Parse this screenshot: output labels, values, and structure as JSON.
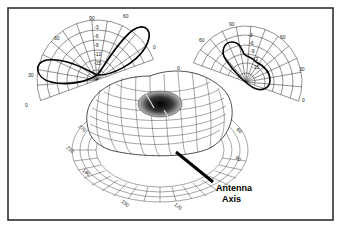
{
  "figure": {
    "frame_color": "#222222",
    "background": "#ffffff"
  },
  "left_polar": {
    "name": "elevation-cut-left",
    "angle_labels": [
      "0",
      "30",
      "60",
      "90",
      "60",
      "0"
    ],
    "radial_labels": [
      "-3",
      "-6",
      "-9",
      "-12",
      "-15"
    ]
  },
  "right_polar": {
    "name": "elevation-cut-right",
    "angle_labels": [
      "0",
      "60",
      "90",
      "60",
      "30",
      "0"
    ],
    "radial_labels": [
      "-3",
      "-6",
      "-9",
      "-12",
      "-15"
    ]
  },
  "base_labels": [
    "270",
    "240",
    "210",
    "180",
    "150",
    "120",
    "90",
    "60"
  ],
  "antenna_axis": {
    "line1": "Antenna",
    "line2": "Axis"
  }
}
